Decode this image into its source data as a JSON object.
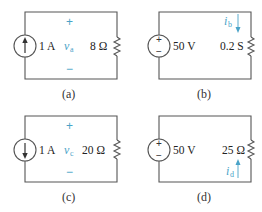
{
  "circuits": [
    {
      "id": "a",
      "caption": "(a)",
      "source_type": "current",
      "source_direction": "up",
      "source_value": "1 A",
      "element_value": "8 Ω",
      "variable": {
        "symbol": "v",
        "subscript": "a",
        "kind": "voltage",
        "plus": "+",
        "minus": "−"
      }
    },
    {
      "id": "b",
      "caption": "(b)",
      "source_type": "voltage",
      "source_value": "50 V",
      "source_plus": "+",
      "source_minus": "−",
      "element_value": "0.2 S",
      "variable": {
        "symbol": "i",
        "subscript": "b",
        "kind": "current",
        "direction": "down"
      }
    },
    {
      "id": "c",
      "caption": "(c)",
      "source_type": "current",
      "source_direction": "down",
      "source_value": "1 A",
      "element_value": "20 Ω",
      "variable": {
        "symbol": "v",
        "subscript": "c",
        "kind": "voltage",
        "plus": "+",
        "minus": "−"
      }
    },
    {
      "id": "d",
      "caption": "(d)",
      "source_type": "voltage",
      "source_value": "50 V",
      "source_plus": "+",
      "source_minus": "−",
      "element_value": "25 Ω",
      "variable": {
        "symbol": "i",
        "subscript": "d",
        "kind": "current",
        "direction": "up"
      }
    }
  ],
  "colors": {
    "wire": "#555555",
    "variable_accent": "#4aa3c8",
    "text": "#222222"
  }
}
